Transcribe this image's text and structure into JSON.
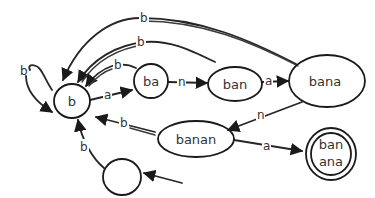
{
  "diagram": {
    "type": "finite-state-automaton",
    "nodes": [
      {
        "id": "start",
        "label": "",
        "accepting": false
      },
      {
        "id": "b",
        "label": "b",
        "accepting": false
      },
      {
        "id": "ba",
        "label": "ba",
        "accepting": false
      },
      {
        "id": "ban",
        "label": "ban",
        "accepting": false
      },
      {
        "id": "bana",
        "label": "bana",
        "accepting": false
      },
      {
        "id": "banan",
        "label": "banan",
        "accepting": false
      },
      {
        "id": "banana",
        "label_line1": "ban",
        "label_line2": "ana",
        "accepting": true
      }
    ],
    "edges": [
      {
        "from": "start",
        "to": "b",
        "label": "b"
      },
      {
        "from": "b",
        "to": "b",
        "label": "b"
      },
      {
        "from": "b",
        "to": "ba",
        "label": "a"
      },
      {
        "from": "ba",
        "to": "ban",
        "label": "n"
      },
      {
        "from": "ban",
        "to": "bana",
        "label": "a"
      },
      {
        "from": "bana",
        "to": "banan",
        "label": "n"
      },
      {
        "from": "banan",
        "to": "banana",
        "label": "a"
      },
      {
        "from": "ba",
        "to": "b",
        "label": "b"
      },
      {
        "from": "ban",
        "to": "b",
        "label": "b"
      },
      {
        "from": "bana",
        "to": "b",
        "label": "b"
      },
      {
        "from": "banan",
        "to": "b",
        "label": "b"
      }
    ],
    "incoming_arrow": {
      "to": "start"
    },
    "colors": {
      "stroke": "#1a1a1a",
      "text": "#333333",
      "background": "#ffffff"
    }
  }
}
